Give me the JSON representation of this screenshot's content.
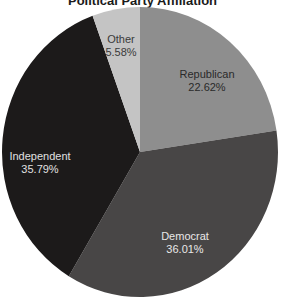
{
  "chart_data": {
    "type": "pie",
    "title": "Political Party Affiliation",
    "start_angle": "12 o'clock",
    "direction": "clockwise",
    "legend": "none (labels inside slices)",
    "slices": [
      {
        "label": "Republican",
        "value": 22.62,
        "value_label": "22.62%",
        "color": "#8e8e8e",
        "text_color": "#2a2a2a"
      },
      {
        "label": "Democrat",
        "value": 36.01,
        "value_label": "36.01%",
        "color": "#484646",
        "text_color": "#e8e8e8"
      },
      {
        "label": "Independent",
        "value": 35.79,
        "value_label": "35.79%",
        "color": "#1c1a1a",
        "text_color": "#e0e0e0"
      },
      {
        "label": "Other",
        "value": 5.58,
        "value_label": "5.58%",
        "color": "#c4c4c4",
        "text_color": "#3a3a3a"
      }
    ],
    "categories": [
      "Republican",
      "Democrat",
      "Independent",
      "Other"
    ],
    "values": [
      22.62,
      36.01,
      35.79,
      5.58
    ]
  }
}
